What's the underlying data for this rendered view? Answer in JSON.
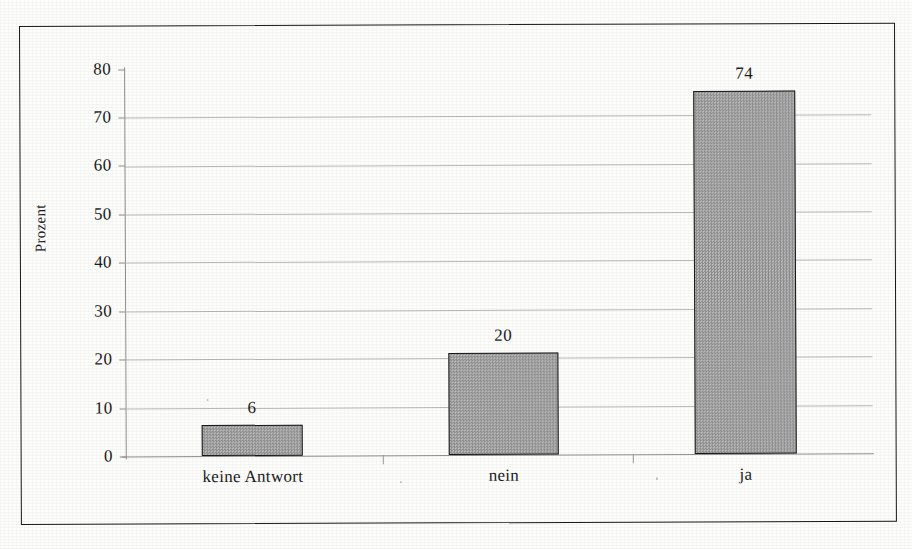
{
  "document": {
    "type": "scanned-bar-chart",
    "language": "de"
  },
  "chart_data": {
    "type": "bar",
    "title": "",
    "subtitle": "",
    "xlabel": "",
    "ylabel": "Prozent",
    "categories": [
      "keine Antwort",
      "nein",
      "ja"
    ],
    "values": [
      6,
      20,
      74
    ],
    "data_labels": [
      "6",
      "20",
      "74"
    ],
    "ylim": [
      0,
      80
    ],
    "yticks": [
      0,
      10,
      20,
      30,
      40,
      50,
      60,
      70,
      80
    ],
    "ytick_labels": [
      "0",
      "10",
      "20",
      "30",
      "40",
      "50",
      "60",
      "70",
      "80"
    ],
    "grid": true,
    "grid_axis": "y",
    "legend": false,
    "legend_position": "none",
    "series": [
      {
        "name": "Prozent",
        "values": [
          6,
          20,
          74
        ],
        "fill_color": "#a8a8a8",
        "border_color": "#171717",
        "pattern": "fine-checker-dither"
      }
    ],
    "bar_render_heights": [
      6.4,
      21.0,
      75.0
    ],
    "colors": {
      "bar_fill": "#a8a8a8",
      "bar_border": "#171717",
      "gridline": "#b9b9b9",
      "axis": "#8e8e8e",
      "frame": "#1a1a1a",
      "text": "#1b1b1b",
      "background": "#fdfdfc"
    }
  },
  "axis": {
    "y_title": "Prozent"
  }
}
